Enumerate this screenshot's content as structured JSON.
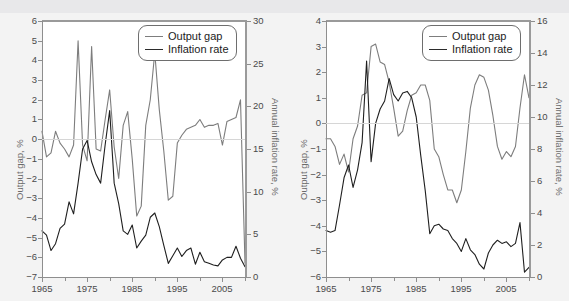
{
  "figure": {
    "background_color": "#f3f3f3",
    "gap_color": "#7d7d7d",
    "inflation_color": "#1f1f1f",
    "top_strip_ghost_text": ""
  },
  "legend": {
    "gap_label": "Output gap",
    "inflation_label": "Inflation rate"
  },
  "chart_data": [
    {
      "type": "line",
      "id": "left-chart",
      "title": "",
      "xlabel": "",
      "ylabel": "Output gap, %",
      "y2label": "Annual inflation rate, %",
      "grid": false,
      "legend_position": "top-right",
      "xlim": [
        1965,
        2010
      ],
      "ylim": [
        -7,
        6
      ],
      "y2lim": [
        0,
        30
      ],
      "xticks": [
        1965,
        1975,
        1985,
        1995,
        2005
      ],
      "xtick_labels": [
        "1965",
        "1975",
        "1985",
        "1995",
        "2005"
      ],
      "xminorticks": [
        1970,
        1980,
        1990,
        2000,
        2010
      ],
      "yticks": [
        6,
        5,
        4,
        3,
        2,
        1,
        0,
        -1,
        -2,
        -3,
        -4,
        -5,
        -6,
        -7
      ],
      "ytick_labels": [
        "6",
        "5",
        "4",
        "3",
        "2",
        "1",
        "0",
        "−1",
        "−2",
        "−3",
        "−4",
        "−5",
        "−6",
        "−7"
      ],
      "y2ticks": [
        30,
        25,
        20,
        15,
        10,
        5,
        0
      ],
      "y2tick_labels": [
        "30",
        "25",
        "20",
        "15",
        "10",
        "5",
        "0"
      ],
      "x": [
        1965,
        1966,
        1967,
        1968,
        1969,
        1970,
        1971,
        1972,
        1973,
        1974,
        1975,
        1976,
        1977,
        1978,
        1979,
        1980,
        1981,
        1982,
        1983,
        1984,
        1985,
        1986,
        1987,
        1988,
        1989,
        1990,
        1991,
        1992,
        1993,
        1994,
        1995,
        1996,
        1997,
        1998,
        1999,
        2000,
        2001,
        2002,
        2003,
        2004,
        2005,
        2006,
        2007,
        2008,
        2009,
        2010
      ],
      "series": [
        {
          "name": "Output gap",
          "axis": "left",
          "unit": "%",
          "values": [
            0.4,
            -0.9,
            -0.7,
            0.4,
            -0.2,
            -0.5,
            -0.9,
            -0.3,
            5.0,
            -0.3,
            -1.1,
            4.7,
            -0.5,
            -0.6,
            1.0,
            2.5,
            -0.4,
            -2.0,
            0.7,
            1.4,
            -1.0,
            -3.9,
            -3.4,
            0.7,
            2.0,
            4.4,
            1.5,
            -0.6,
            -3.1,
            -2.9,
            -0.2,
            0.2,
            0.5,
            0.6,
            0.7,
            1.0,
            0.6,
            0.7,
            0.7,
            0.8,
            -0.3,
            0.9,
            1.0,
            1.1,
            2.0,
            -6.3
          ]
        },
        {
          "name": "Inflation rate",
          "axis": "right",
          "unit": "%",
          "values": [
            5.4,
            4.9,
            3.1,
            3.9,
            5.7,
            6.2,
            8.8,
            7.4,
            11.0,
            15.0,
            16.0,
            13.5,
            12.0,
            11.0,
            15.5,
            19.5,
            11.0,
            8.6,
            5.4,
            5.0,
            6.1,
            3.4,
            4.2,
            4.9,
            7.0,
            7.5,
            5.9,
            3.7,
            1.6,
            2.5,
            3.4,
            2.4,
            3.1,
            3.4,
            1.5,
            2.9,
            1.8,
            1.6,
            1.4,
            1.3,
            2.0,
            2.3,
            2.3,
            3.6,
            2.2,
            1.2
          ]
        }
      ]
    },
    {
      "type": "line",
      "id": "right-chart",
      "title": "",
      "xlabel": "",
      "ylabel": "Output gap, %",
      "y2label": "Annual inflation rate, %",
      "grid": false,
      "legend_position": "top-right",
      "xlim": [
        1965,
        2010
      ],
      "ylim": [
        -6,
        4
      ],
      "y2lim": [
        0,
        16
      ],
      "xticks": [
        1965,
        1975,
        1985,
        1995,
        2005
      ],
      "xtick_labels": [
        "1965",
        "1975",
        "1985",
        "1995",
        "2005"
      ],
      "xminorticks": [
        1970,
        1980,
        1990,
        2000,
        2010
      ],
      "yticks": [
        4,
        3,
        2,
        1,
        0,
        -1,
        -2,
        -3,
        -4,
        -5,
        -6
      ],
      "ytick_labels": [
        "4",
        "3",
        "2",
        "1",
        "0",
        "−1",
        "−2",
        "−3",
        "−4",
        "−5",
        "−6"
      ],
      "y2ticks": [
        16,
        14,
        12,
        10,
        8,
        6,
        4,
        2,
        0
      ],
      "y2tick_labels": [
        "16",
        "14",
        "12",
        "10",
        "8",
        "6",
        "4",
        "2",
        "0"
      ],
      "x": [
        1965,
        1966,
        1967,
        1968,
        1969,
        1970,
        1971,
        1972,
        1973,
        1974,
        1975,
        1976,
        1977,
        1978,
        1979,
        1980,
        1981,
        1982,
        1983,
        1984,
        1985,
        1986,
        1987,
        1988,
        1989,
        1990,
        1991,
        1992,
        1993,
        1994,
        1995,
        1996,
        1997,
        1998,
        1999,
        2000,
        2001,
        2002,
        2003,
        2004,
        2005,
        2006,
        2007,
        2008,
        2009,
        2010
      ],
      "series": [
        {
          "name": "Output gap",
          "axis": "left",
          "unit": "%",
          "values": [
            -0.6,
            -0.6,
            -0.9,
            -1.6,
            -1.2,
            -1.9,
            -0.6,
            -0.1,
            1.1,
            1.2,
            3.0,
            3.1,
            2.4,
            2.3,
            1.6,
            0.6,
            -0.5,
            -0.3,
            0.5,
            1.1,
            1.2,
            1.5,
            1.5,
            0.9,
            -1.0,
            -1.3,
            -2.0,
            -2.6,
            -2.6,
            -3.1,
            -2.6,
            -1.1,
            0.6,
            1.5,
            1.9,
            1.8,
            1.3,
            0.3,
            -0.9,
            -1.4,
            -1.1,
            -1.3,
            -0.9,
            0.6,
            1.9,
            1.0
          ]
        },
        {
          "name": "Inflation rate",
          "axis": "right",
          "unit": "%",
          "values": [
            2.9,
            2.8,
            2.9,
            4.5,
            6.2,
            7.0,
            5.6,
            6.7,
            8.4,
            13.5,
            7.2,
            9.6,
            10.5,
            11.0,
            12.4,
            11.4,
            11.0,
            11.5,
            11.6,
            11.2,
            10.0,
            7.6,
            5.4,
            2.7,
            3.2,
            3.3,
            3.0,
            2.9,
            2.4,
            2.1,
            1.6,
            2.4,
            1.7,
            1.4,
            0.8,
            0.5,
            1.5,
            2.0,
            2.3,
            2.1,
            2.2,
            1.9,
            2.1,
            3.4,
            0.3,
            0.6
          ]
        }
      ]
    }
  ]
}
